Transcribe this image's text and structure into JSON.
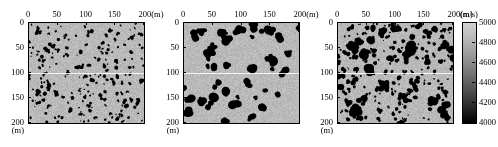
{
  "figure": {
    "type": "velocity-model-triptych",
    "background_color": "#b9b9b9",
    "inclusion_color": "#000000"
  },
  "axes": {
    "x_ticks": [
      "0",
      "50",
      "100",
      "150",
      "200"
    ],
    "x_unit": "(m)",
    "x_last_label": "200(m)",
    "y_ticks": [
      "0",
      "50",
      "100",
      "150",
      "200"
    ],
    "y_unit": "(m)",
    "x_range": [
      0,
      200
    ],
    "y_range": [
      0,
      200
    ]
  },
  "colorbar": {
    "unit": "(m/s)",
    "ticks": [
      "5000",
      "4800",
      "4600",
      "4400",
      "4200",
      "4000"
    ],
    "max": 5000,
    "min": 4000,
    "orientation": "vertical",
    "top_color": "#d2d2d2",
    "bottom_color": "#000000"
  },
  "panels": [
    {
      "name": "panel-left",
      "index": 1,
      "description": "dense small-scale speckled inclusions"
    },
    {
      "name": "panel-middle",
      "index": 2,
      "description": "sparse large-scale blob inclusions"
    },
    {
      "name": "panel-right",
      "index": 3,
      "description": "combined large blobs and small speckles"
    }
  ],
  "chart_data": {
    "type": "heatmap",
    "title": "",
    "xlabel": "(m)",
    "ylabel": "(m)",
    "xlim": [
      0,
      200
    ],
    "ylim": [
      0,
      200
    ],
    "grid": false,
    "legend_position": "right",
    "colorbar": {
      "label": "(m/s)",
      "vmin": 4000,
      "vmax": 5000,
      "ticks": [
        5000,
        4800,
        4600,
        4400,
        4200,
        4000
      ],
      "cmap": "gray"
    },
    "series": [
      {
        "name": "panel-left",
        "background_velocity": 4900,
        "inclusion_velocity": 4000,
        "scale": "small",
        "blob_count": 240,
        "blob_radius_px": [
          0.7,
          2.2
        ]
      },
      {
        "name": "panel-middle",
        "background_velocity": 4900,
        "inclusion_velocity": 4000,
        "scale": "large",
        "blob_count": 46,
        "blob_radius_px": [
          1.8,
          4.6
        ]
      },
      {
        "name": "panel-right",
        "background_velocity": 4900,
        "inclusion_velocity": 4000,
        "scale": "mixed",
        "blob_count": 250,
        "blob_radius_px": [
          0.7,
          4.6
        ]
      }
    ],
    "annotations": [
      {
        "type": "horizontal-line",
        "y": 100,
        "color": "#ffffff",
        "panels": [
          1,
          2,
          3
        ]
      }
    ]
  }
}
